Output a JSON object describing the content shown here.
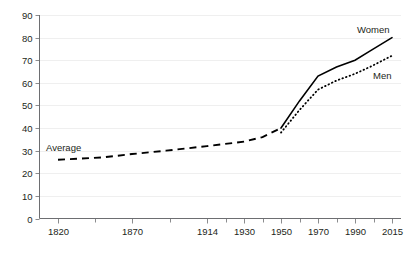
{
  "chart_data": {
    "type": "line",
    "title": "",
    "subtitle": "",
    "xlabel": "",
    "ylabel": "",
    "grid": true,
    "legend_position": "inline-annotations",
    "xlim": [
      1820,
      2015
    ],
    "ylim": [
      0,
      90
    ],
    "y_ticks": [
      0,
      10,
      20,
      30,
      40,
      50,
      60,
      70,
      80,
      90
    ],
    "x_ticks": [
      1820,
      1870,
      1914,
      1930,
      1950,
      1970,
      1990,
      2015
    ],
    "x_tick_labels": [
      "1820",
      "1870",
      "1914",
      "1930",
      "1950",
      "1970",
      "1990",
      "2015"
    ],
    "y_tick_labels": [
      "0",
      "10",
      "20",
      "30",
      "40",
      "50",
      "60",
      "70",
      "80",
      "90"
    ],
    "series": [
      {
        "name": "Average",
        "style": "dashed",
        "color": "#000000",
        "x": [
          1820,
          1850,
          1870,
          1890,
          1914,
          1930,
          1940,
          1950
        ],
        "values": [
          26,
          27,
          28.5,
          30,
          32,
          34,
          36,
          40
        ]
      },
      {
        "name": "Women",
        "style": "solid",
        "color": "#000000",
        "x": [
          1950,
          1960,
          1970,
          1980,
          1990,
          2000,
          2015
        ],
        "values": [
          40,
          52,
          63,
          67,
          70,
          74,
          80
        ]
      },
      {
        "name": "Men",
        "style": "dotted",
        "color": "#000000",
        "x": [
          1950,
          1960,
          1970,
          1980,
          1990,
          2000,
          2015
        ],
        "values": [
          38,
          48,
          57,
          61,
          64,
          67,
          72
        ]
      }
    ],
    "annotations": [
      {
        "name": "average-label",
        "text": "Average",
        "x": 1836,
        "y": 34
      },
      {
        "name": "women-label",
        "text": "Women",
        "x": 1988,
        "y": 86
      },
      {
        "name": "men-label",
        "text": "Men",
        "x": 1998,
        "y": 68
      }
    ]
  }
}
